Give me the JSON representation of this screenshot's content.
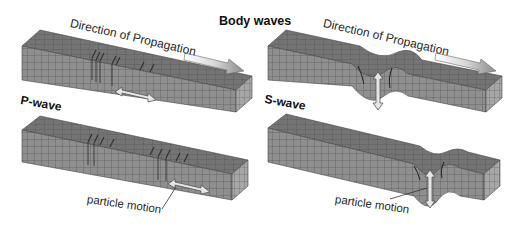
{
  "title": "Body waves",
  "colors": {
    "block_front": "#8d8d8d",
    "block_top": "#6f6f6f",
    "block_side": "#a2a2a2",
    "grid_line": "#4f4f4f",
    "arrow_fill": "#e4e4e4",
    "arrow_stroke": "#555555",
    "text": "#222222"
  },
  "panels": [
    {
      "id": "p-wave-top",
      "wave": "P-wave",
      "direction_label": "Direction of Propagation",
      "motion": "horizontal (compression/dilation)"
    },
    {
      "id": "p-wave-bottom",
      "wave": "P-wave",
      "particle_label": "particle motion",
      "motion": "horizontal (compression/dilation)"
    },
    {
      "id": "s-wave-top",
      "wave": "S-wave",
      "direction_label": "Direction of Propagation",
      "motion": "vertical (shear)"
    },
    {
      "id": "s-wave-bottom",
      "wave": "S-wave",
      "particle_label": "particle motion",
      "motion": "vertical (shear)"
    }
  ],
  "labels": {
    "p_wave": "P-wave",
    "s_wave": "S-wave",
    "direction_left": "Direction of Propagation",
    "direction_right": "Direction of Propagation",
    "particle_left": "particle motion",
    "particle_right": "particle motion"
  }
}
